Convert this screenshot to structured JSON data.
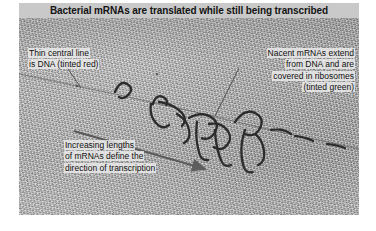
{
  "figure": {
    "title": "Bacterial mRNAs are translated while still being transcribed",
    "title_bar_color": "#c9c9c9",
    "micrograph_background_color": "#b5b5b5",
    "annotation_text_color": "#111111",
    "leader_line_color": "#3a3a3a",
    "arrow_color": "#5a5a5a",
    "dna_line_color": "#555555"
  },
  "annotations": {
    "dna": {
      "name": "thin-central-line-label",
      "lines": [
        "Thin central line",
        "is DNA (tinted red)"
      ],
      "text": "Thin central line\nis DNA (tinted red)",
      "align": "left"
    },
    "mrna": {
      "name": "nacent-mrna-label",
      "lines": [
        "Nacent mRNAs extend",
        "from DNA and are",
        "covered in ribosomes",
        "(tinted green)"
      ],
      "text": "Nacent mRNAs extend\nfrom DNA and are\ncovered in ribosomes\n(tinted green)",
      "align": "right"
    },
    "direction": {
      "name": "direction-of-transcription-label",
      "lines": [
        "Increasing lengths",
        "of mRNAs define the",
        "direction of transcription"
      ],
      "text": "Increasing lengths\nof mRNAs define the\ndirection of transcription",
      "align": "left"
    }
  },
  "micrograph": {
    "type": "electron-micrograph",
    "description": "Miller chromatin spread showing a DNA strand with nascent mRNA fibrils coated with ribosomes",
    "dna_axis": {
      "x1": 0,
      "y1": 56,
      "x2": 340,
      "y2": 128
    },
    "direction_arrow": {
      "x1": 55,
      "y1": 113,
      "x2": 190,
      "y2": 152
    },
    "fibril_clusters": 7
  }
}
